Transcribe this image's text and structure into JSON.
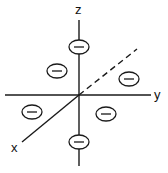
{
  "diagram": {
    "axes": {
      "x_label": "x",
      "y_label": "y",
      "z_label": "z"
    },
    "charges": [
      {
        "id": "top",
        "symbol": "−",
        "cx": 79,
        "cy": 47
      },
      {
        "id": "bottom",
        "symbol": "−",
        "cx": 79,
        "cy": 142
      },
      {
        "id": "upper-left",
        "symbol": "−",
        "cx": 57,
        "cy": 71
      },
      {
        "id": "upper-right",
        "symbol": "−",
        "cx": 129,
        "cy": 79
      },
      {
        "id": "lower-left",
        "symbol": "−",
        "cx": 32,
        "cy": 112
      },
      {
        "id": "lower-right",
        "symbol": "−",
        "cx": 106,
        "cy": 114
      }
    ],
    "colors": {
      "ink": "#1a1a1a",
      "background": "#ffffff"
    }
  }
}
